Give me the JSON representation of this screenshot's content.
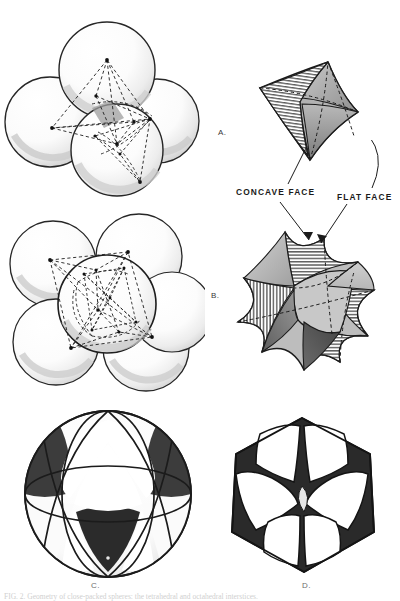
{
  "plate": {
    "background": "#ffffff",
    "width": 400,
    "height": 601,
    "caption": "FIG. 2. Geometry of close-packed spheres: the tetrahedral and octahedral interstices."
  },
  "panel_labels": {
    "a": "A.",
    "b": "B.",
    "c": "C.",
    "d": "D."
  },
  "callouts": {
    "concave": "CONCAVE FACE",
    "flat": "FLAT FACE"
  },
  "colors": {
    "ink": "#1a1a1a",
    "outline": "#222222",
    "sphere_light": "#fefefe",
    "sphere_shade": "#e4e4e4",
    "sphere_deep": "#cfcfcf",
    "solid_light": "#d9d9d9",
    "solid_mid": "#b4b4b4",
    "solid_dark": "#8a8a8a",
    "solid_darkest": "#5a5a5a",
    "fill_black": "#2b2b2b",
    "fill_white": "#ffffff",
    "hatch": "#2e2e2e",
    "dash": "#1e1e1e",
    "label_grey": "#6d6d6d"
  },
  "figures": {
    "tetra_cluster": {
      "name": "four-sphere-tetrahedral-cluster",
      "sphere_count": 4,
      "inscribed": "tetrahedron",
      "spheres": [
        {
          "cx": 105,
          "cy": 65,
          "r": 47
        },
        {
          "cx": 52,
          "cy": 120,
          "r": 43
        },
        {
          "cx": 152,
          "cy": 118,
          "r": 41
        },
        {
          "cx": 112,
          "cy": 145,
          "r": 45
        }
      ]
    },
    "octa_cluster": {
      "name": "six-sphere-octahedral-cluster",
      "sphere_count": 6,
      "inscribed": "octahedron",
      "spheres": [
        {
          "cx": 58,
          "cy": 263,
          "r": 42
        },
        {
          "cx": 140,
          "cy": 255,
          "r": 42
        },
        {
          "cx": 60,
          "cy": 341,
          "r": 42
        },
        {
          "cx": 148,
          "cy": 348,
          "r": 42
        },
        {
          "cx": 108,
          "cy": 300,
          "r": 45
        }
      ]
    },
    "curved_tetrahedron": {
      "name": "curved-tetrahedron-solid",
      "faces": 4,
      "face_kinds": [
        "concave-hatched",
        "flat-shaded"
      ]
    },
    "curved_octahedron": {
      "name": "curved-octahedron-solid",
      "faces": 8,
      "face_kinds": [
        "concave-hatched",
        "flat-shaded"
      ]
    },
    "sphere_octant_map": {
      "name": "sphere-with-great-circles",
      "great_circles": 3,
      "regions": [
        "white-curved-triangle",
        "black-curved-triangle"
      ]
    },
    "hex_projection": {
      "name": "hexagonal-projection-pattern",
      "outline": "hexagon",
      "regions": [
        "white-curved-square",
        "black-concave-triangle"
      ]
    }
  }
}
